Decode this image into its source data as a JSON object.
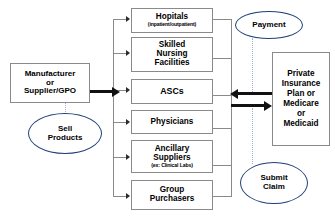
{
  "diagram": {
    "colors": {
      "callout_outline": "#1f3f7a",
      "box_outline": "#8a8a8a",
      "arrow": "#111111",
      "leader": "#9fb4d6",
      "background": "#ffffff"
    },
    "nodes": {
      "manufacturer": {
        "lines": [
          "Manufacturer",
          "or",
          "Supplier/GPO"
        ]
      },
      "hospitals": {
        "title": "Hopitals",
        "subtitle": "(inpatient/outpatient)"
      },
      "skilled_nursing": {
        "lines": [
          "Skilled",
          "Nursing",
          "Facilities"
        ]
      },
      "ascs": {
        "title": "ASCs"
      },
      "physicians": {
        "title": "Physicians"
      },
      "ancillary": {
        "lines": [
          "Ancillary",
          "Suppliers"
        ],
        "subtitle": "(ex: Clinical Labs)"
      },
      "group_purchasers": {
        "lines": [
          "Group",
          "Purchasers"
        ]
      },
      "payer": {
        "lines": [
          "Private",
          "Insurance",
          "Plan or",
          "Medicare",
          "or",
          "Medicaid"
        ]
      }
    },
    "callouts": {
      "sell_products": {
        "lines": [
          "Sell",
          "Products"
        ]
      },
      "payment": {
        "lines": [
          "Payment"
        ]
      },
      "submit_claim": {
        "lines": [
          "Submit",
          "Claim"
        ]
      }
    },
    "edges": {
      "sell_flow": "Manufacturer or Supplier/GPO sells products to providers",
      "payment_flow": "Payer sends payment to providers",
      "claim_flow": "Providers submit claim to payer"
    }
  }
}
